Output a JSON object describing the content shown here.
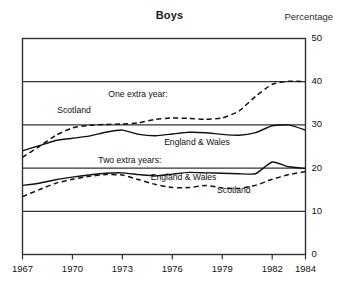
{
  "chart_data": {
    "type": "line",
    "title": "Boys",
    "unit_label": "Percentage",
    "xlabel": "",
    "ylabel": "Percentage",
    "xlim": [
      1967,
      1984
    ],
    "ylim": [
      0,
      50
    ],
    "grid": true,
    "gridlines_y": [
      10,
      20,
      30,
      40
    ],
    "legend_position": "inline-annotations",
    "xticks": [
      1967,
      1970,
      1973,
      1976,
      1979,
      1982,
      1984
    ],
    "xtick_labels": [
      "1967",
      "1970",
      "1973",
      "1976",
      "1979",
      "1982",
      "1984"
    ],
    "yticks": [
      0,
      10,
      20,
      30,
      40,
      50
    ],
    "ytick_labels": [
      "0",
      "10",
      "20",
      "30",
      "40",
      "50"
    ],
    "group_labels": [
      {
        "text": "One extra year:",
        "x": 1974.2,
        "y": 37.0
      },
      {
        "text": "Two extra years:",
        "x": 1973.6,
        "y": 21.6
      }
    ],
    "x": [
      1967,
      1968,
      1969,
      1970,
      1971,
      1972,
      1973,
      1974,
      1975,
      1976,
      1977,
      1978,
      1979,
      1980,
      1981,
      1982,
      1983,
      1984
    ],
    "series": [
      {
        "name": "Scotland",
        "group": "One extra year",
        "style": "dashed",
        "label_x": 1970.1,
        "label_y": 33.2,
        "values": [
          22.5,
          25.0,
          27.6,
          29.3,
          29.9,
          30.1,
          30.2,
          30.5,
          31.3,
          31.6,
          31.5,
          31.3,
          31.6,
          33.2,
          36.6,
          39.4,
          40.1,
          40.0
        ]
      },
      {
        "name": "England & Wales",
        "group": "One extra year",
        "style": "solid",
        "label_x": 1977.4,
        "label_y": 25.9,
        "values": [
          24.0,
          25.2,
          26.4,
          26.9,
          27.4,
          28.3,
          28.8,
          27.8,
          27.5,
          27.9,
          28.3,
          28.2,
          27.8,
          27.6,
          28.2,
          29.8,
          30.0,
          28.8
        ]
      },
      {
        "name": "England & Wales",
        "group": "Two extra years",
        "style": "solid",
        "label_x": 1976.6,
        "label_y": 17.6,
        "values": [
          16.0,
          16.5,
          17.3,
          17.9,
          18.4,
          18.8,
          18.9,
          18.5,
          18.2,
          18.6,
          19.0,
          18.9,
          18.8,
          18.7,
          18.7,
          21.4,
          20.3,
          19.9
        ]
      },
      {
        "name": "Scotland",
        "group": "Two extra years",
        "style": "dashed",
        "label_x": 1979.7,
        "label_y": 14.7,
        "values": [
          13.4,
          15.0,
          16.5,
          17.4,
          18.1,
          18.5,
          18.4,
          17.3,
          16.2,
          15.5,
          15.5,
          16.0,
          15.4,
          15.3,
          16.0,
          17.4,
          18.5,
          19.2
        ]
      }
    ]
  }
}
